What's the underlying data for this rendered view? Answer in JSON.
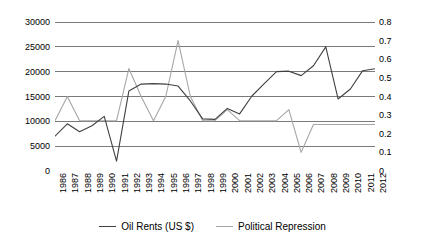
{
  "chart_data": {
    "type": "line",
    "title": "",
    "xlabel": "",
    "grid": true,
    "legend_position": "bottom",
    "categories": [
      "1986",
      "1987",
      "1988",
      "1989",
      "1990",
      "1991",
      "1992",
      "1993",
      "1994",
      "1995",
      "1996",
      "1997",
      "1998",
      "1999",
      "2000",
      "2001",
      "2002",
      "2003",
      "2004",
      "2005",
      "2006",
      "2007",
      "2008",
      "2009",
      "2010",
      "2011",
      "2012"
    ],
    "axes": {
      "left": {
        "label": "Oil Rents (US $)",
        "ylim": [
          0,
          30000
        ],
        "tick_step": 5000,
        "ticks": [
          "0",
          "5000",
          "10000",
          "15000",
          "20000",
          "25000",
          "30000"
        ],
        "tick_values": [
          0,
          5000,
          10000,
          15000,
          20000,
          25000,
          30000
        ]
      },
      "right": {
        "label": "Political Repression",
        "ylim": [
          0,
          0.8
        ],
        "tick_step": 0.1,
        "ticks": [
          "0",
          "0.1",
          "0.2",
          "0.3",
          "0.4",
          "0.5",
          "0.6",
          "0.7",
          "0.8"
        ],
        "tick_values": [
          0,
          0.1,
          0.2,
          0.3,
          0.4,
          0.5,
          0.6,
          0.7,
          0.8
        ]
      }
    },
    "series": [
      {
        "name": "Oil Rents (US $)",
        "axis": "left",
        "color": "#404040",
        "values": [
          7000,
          9500,
          7900,
          9100,
          11000,
          2000,
          16100,
          17500,
          17600,
          17500,
          17100,
          14100,
          10500,
          10400,
          12600,
          11500,
          15100,
          17600,
          20000,
          20100,
          19200,
          21200,
          25000,
          14500,
          16500,
          20200,
          20600
        ]
      },
      {
        "name": "Political Repression",
        "axis": "right",
        "color": "#a6a6a6",
        "values": [
          0.27,
          0.4,
          0.27,
          0.27,
          0.27,
          0.27,
          0.55,
          0.4,
          0.27,
          0.4,
          0.7,
          0.4,
          0.27,
          0.27,
          0.33,
          0.27,
          0.27,
          0.27,
          0.27,
          0.33,
          0.1,
          0.25,
          0.25,
          0.25,
          0.25,
          0.25,
          0.25
        ]
      }
    ]
  },
  "legend": {
    "entries": [
      {
        "label": "Oil Rents (US $)",
        "color": "#404040"
      },
      {
        "label": "Political Repression",
        "color": "#a6a6a6"
      }
    ]
  }
}
